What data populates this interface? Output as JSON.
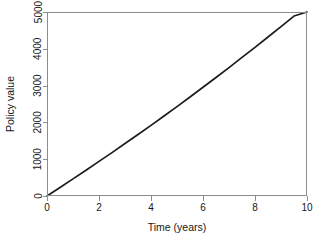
{
  "chart_data": {
    "type": "line",
    "title": "",
    "subtitle": "",
    "xlabel": "Time (years)",
    "ylabel": "Policy value",
    "xlim": [
      0,
      10
    ],
    "ylim": [
      0,
      5000
    ],
    "xticks": [
      0,
      2,
      4,
      6,
      8,
      10
    ],
    "xticklabels": [
      "0",
      "2",
      "4",
      "6",
      "8",
      "10"
    ],
    "yticks": [
      0,
      1000,
      2000,
      3000,
      4000,
      5000
    ],
    "yticklabels": [
      "0",
      "1000",
      "2000",
      "3000",
      "4000",
      "5000"
    ],
    "grid": false,
    "legend": null,
    "legend_position": "none",
    "axis_style": "box",
    "ytick_label_rotation": 90,
    "series": [
      {
        "name": "Policy value",
        "color": "#1c1c1c",
        "linewidth": 1.7,
        "x": [
          0,
          0.5,
          1,
          1.5,
          2,
          2.5,
          3,
          3.5,
          4,
          4.5,
          5,
          5.5,
          6,
          6.5,
          7,
          7.5,
          8,
          8.5,
          9,
          9.5,
          10
        ],
        "values": [
          0,
          230,
          465,
          700,
          940,
          1180,
          1425,
          1670,
          1920,
          2175,
          2430,
          2690,
          2955,
          3220,
          3490,
          3765,
          4040,
          4320,
          4605,
          4890,
          5000
        ]
      }
    ],
    "annotations": []
  },
  "colors": {
    "background": "#ffffff",
    "frame": "#8c8c8c",
    "line": "#1c1c1c",
    "text": "#161616"
  }
}
